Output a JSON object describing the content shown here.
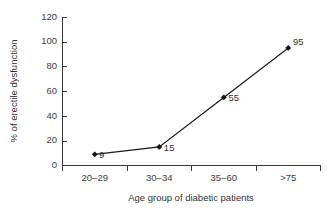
{
  "chart_data": {
    "type": "line",
    "title": "",
    "xlabel": "Age group of diabetic patients",
    "ylabel": "% of erectile dysfunction",
    "categories": [
      "20–29",
      "30–34",
      "35–60",
      ">75"
    ],
    "values": [
      9,
      15,
      55,
      95
    ],
    "point_labels": [
      "9",
      "15",
      "55",
      "95"
    ],
    "ylim": [
      0,
      120
    ],
    "ytick_labels": [
      "0",
      "20",
      "40",
      "60",
      "80",
      "100",
      "120"
    ],
    "ytick_values": [
      0,
      20,
      40,
      60,
      80,
      100,
      120
    ],
    "grid": false,
    "legend": false,
    "marker": "diamond",
    "series_color": "#111111"
  }
}
